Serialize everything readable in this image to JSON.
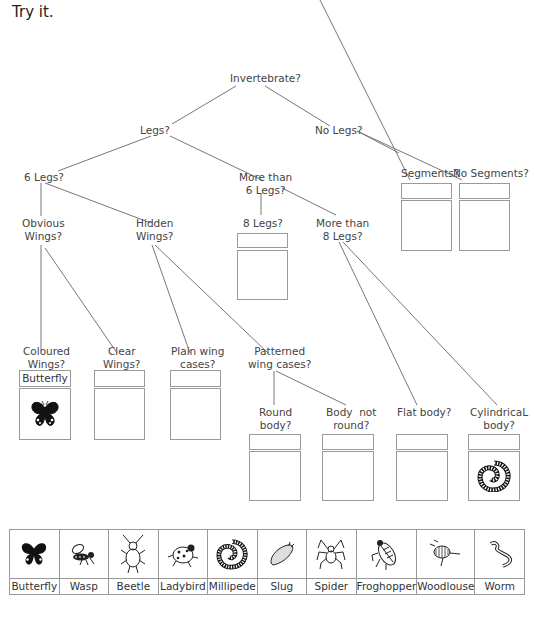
{
  "title": "Try it.",
  "tree": {
    "root": "Invertebrate?",
    "legs": "Legs?",
    "no_legs": "No Legs?",
    "six_legs": "6 Legs?",
    "more_than_six": [
      "More than",
      "6 Legs?"
    ],
    "segments": "Segments?",
    "no_segments": "No Segments?",
    "obvious_wings": [
      "Obvious",
      "Wings?"
    ],
    "hidden_wings": [
      "Hidden",
      "Wings?"
    ],
    "eight_legs": "8 Legs?",
    "more_than_eight": [
      "More than",
      "8 Legs?"
    ],
    "coloured_wings": [
      "Coloured",
      "Wings?"
    ],
    "clear_wings": [
      "Clear",
      "Wings?"
    ],
    "plain_wing_cases": [
      "Plain wing",
      "cases?"
    ],
    "patterned_wing_cases": [
      "Patterned",
      "wing cases?"
    ],
    "round_body": [
      "Round",
      "body?"
    ],
    "body_not_round": [
      "Body  not",
      "round?"
    ],
    "flat_body": "Flat body?",
    "cylindrical_body": [
      "CylindricaL",
      "body?"
    ]
  },
  "answers": {
    "coloured_wings": {
      "label": "Butterfly",
      "icon": "butterfly-icon"
    },
    "clear_wings": {
      "label": "",
      "icon": ""
    },
    "plain_wing_cases": {
      "label": "",
      "icon": ""
    },
    "round_body": {
      "label": "",
      "icon": ""
    },
    "body_not_round": {
      "label": "",
      "icon": ""
    },
    "flat_body": {
      "label": "",
      "icon": ""
    },
    "cylindrical_body": {
      "label": "",
      "icon": "millipede-icon"
    },
    "eight_legs": {
      "label": "",
      "icon": ""
    },
    "segments": {
      "label": "",
      "icon": ""
    },
    "no_segments": {
      "label": "",
      "icon": ""
    }
  },
  "animals": [
    {
      "name": "Butterfly",
      "icon": "butterfly-icon"
    },
    {
      "name": "Wasp",
      "icon": "wasp-icon"
    },
    {
      "name": "Beetle",
      "icon": "beetle-icon"
    },
    {
      "name": "Ladybird",
      "icon": "ladybird-icon"
    },
    {
      "name": "Millipede",
      "icon": "millipede-icon"
    },
    {
      "name": "Slug",
      "icon": "slug-icon"
    },
    {
      "name": "Spider",
      "icon": "spider-icon"
    },
    {
      "name": "Froghopper",
      "icon": "froghopper-icon"
    },
    {
      "name": "Woodlouse",
      "icon": "woodlouse-icon"
    },
    {
      "name": "Worm",
      "icon": "worm-icon"
    }
  ],
  "colors": {
    "line": "#777777",
    "box_border": "#9a9a9a",
    "text": "#333333"
  }
}
